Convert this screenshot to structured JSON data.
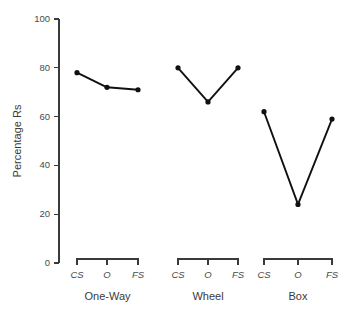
{
  "chart_data": {
    "type": "line",
    "title": "",
    "xlabel": "",
    "ylabel": "Percentage Rs",
    "ylim": [
      0,
      100
    ],
    "yticks": [
      0,
      20,
      40,
      60,
      80,
      100
    ],
    "ytick_labels": [
      "0",
      "20",
      "40",
      "60",
      "80",
      "100"
    ],
    "grid": false,
    "legend": "none",
    "categories": [
      "CS",
      "O",
      "FS"
    ],
    "groups": [
      {
        "name": "One-Way",
        "categories": [
          "CS",
          "O",
          "FS"
        ],
        "values": [
          78,
          72,
          71
        ]
      },
      {
        "name": "Wheel",
        "categories": [
          "CS",
          "O",
          "FS"
        ],
        "values": [
          80,
          66,
          80
        ]
      },
      {
        "name": "Box",
        "categories": [
          "CS",
          "O",
          "FS"
        ],
        "values": [
          62,
          24,
          59
        ]
      }
    ],
    "colors": {
      "line": "#111111",
      "axis": "#3a3a3a",
      "text": "#4a4a4a",
      "background": "#ffffff"
    }
  }
}
